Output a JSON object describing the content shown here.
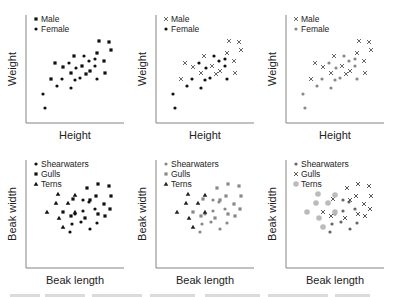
{
  "figure": {
    "colors": {
      "black": "#111111",
      "gray": "#888888",
      "light_gray": "#bbbbbb",
      "axis": "#777777"
    }
  },
  "chart_data": [
    {
      "type": "scatter",
      "panel": "top-left",
      "xlabel": "Height",
      "ylabel": "Weight",
      "legend": [
        {
          "label": "Male",
          "marker": "square",
          "color": "#111111"
        },
        {
          "label": "Female",
          "marker": "dot",
          "color": "#111111"
        }
      ],
      "series": [
        {
          "name": "Male",
          "marker": "square",
          "color": "#111111",
          "points": [
            [
              99,
              41
            ],
            [
              109,
              42
            ],
            [
              111,
              50
            ],
            [
              97,
              53
            ],
            [
              74,
              56
            ],
            [
              55,
              63
            ],
            [
              63,
              67
            ],
            [
              82,
              66
            ],
            [
              104,
              61
            ],
            [
              71,
              73
            ],
            [
              86,
              74
            ],
            [
              90,
              71
            ],
            [
              105,
              73
            ],
            [
              51,
              79
            ]
          ]
        },
        {
          "name": "Female",
          "marker": "dot",
          "color": "#111111",
          "points": [
            [
              43,
              94
            ],
            [
              45,
              108
            ],
            [
              57,
              86
            ],
            [
              62,
              79
            ],
            [
              69,
              63
            ],
            [
              71,
              88
            ],
            [
              76,
              68
            ],
            [
              75,
              80
            ],
            [
              84,
              56
            ],
            [
              80,
              78
            ],
            [
              89,
              61
            ],
            [
              95,
              59
            ],
            [
              95,
              66
            ],
            [
              97,
              79
            ]
          ]
        }
      ]
    },
    {
      "type": "scatter",
      "panel": "top-middle",
      "xlabel": "Height",
      "ylabel": "Weight",
      "legend": [
        {
          "label": "Male",
          "marker": "x",
          "color": "#555555"
        },
        {
          "label": "Female",
          "marker": "dot",
          "color": "#111111"
        }
      ],
      "series": [
        {
          "name": "Male",
          "marker": "x",
          "color": "#555555",
          "points": [
            [
              99,
              41
            ],
            [
              109,
              42
            ],
            [
              111,
              50
            ],
            [
              97,
              53
            ],
            [
              74,
              56
            ],
            [
              55,
              63
            ],
            [
              63,
              67
            ],
            [
              82,
              66
            ],
            [
              104,
              61
            ],
            [
              71,
              73
            ],
            [
              86,
              74
            ],
            [
              90,
              71
            ],
            [
              105,
              73
            ],
            [
              51,
              79
            ]
          ]
        },
        {
          "name": "Female",
          "marker": "dot",
          "color": "#111111",
          "points": [
            [
              43,
              94
            ],
            [
              45,
              108
            ],
            [
              57,
              86
            ],
            [
              62,
              79
            ],
            [
              69,
              63
            ],
            [
              71,
              88
            ],
            [
              76,
              68
            ],
            [
              75,
              80
            ],
            [
              84,
              56
            ],
            [
              80,
              78
            ],
            [
              89,
              61
            ],
            [
              95,
              59
            ],
            [
              95,
              66
            ],
            [
              97,
              79
            ]
          ]
        }
      ]
    },
    {
      "type": "scatter",
      "panel": "top-right",
      "xlabel": "Height",
      "ylabel": "Weight",
      "legend": [
        {
          "label": "Male",
          "marker": "x",
          "color": "#555555"
        },
        {
          "label": "Female",
          "marker": "dot",
          "color": "#888888"
        }
      ],
      "series": [
        {
          "name": "Male",
          "marker": "x",
          "color": "#555555",
          "points": [
            [
              99,
              41
            ],
            [
              109,
              42
            ],
            [
              111,
              50
            ],
            [
              97,
              53
            ],
            [
              74,
              56
            ],
            [
              55,
              63
            ],
            [
              63,
              67
            ],
            [
              82,
              66
            ],
            [
              104,
              61
            ],
            [
              71,
              73
            ],
            [
              86,
              74
            ],
            [
              90,
              71
            ],
            [
              105,
              73
            ],
            [
              51,
              79
            ]
          ]
        },
        {
          "name": "Female",
          "marker": "dot",
          "color": "#888888",
          "points": [
            [
              43,
              94
            ],
            [
              45,
              108
            ],
            [
              57,
              86
            ],
            [
              62,
              79
            ],
            [
              69,
              63
            ],
            [
              71,
              88
            ],
            [
              76,
              68
            ],
            [
              75,
              80
            ],
            [
              84,
              56
            ],
            [
              80,
              78
            ],
            [
              89,
              61
            ],
            [
              95,
              59
            ],
            [
              95,
              66
            ],
            [
              97,
              79
            ]
          ]
        }
      ]
    },
    {
      "type": "scatter",
      "panel": "bottom-left",
      "xlabel": "Beak length",
      "ylabel": "Beak width",
      "legend": [
        {
          "label": "Shearwaters",
          "marker": "dot",
          "color": "#111111"
        },
        {
          "label": "Gulls",
          "marker": "square",
          "color": "#111111"
        },
        {
          "label": "Terns",
          "marker": "triangle",
          "color": "#111111"
        }
      ],
      "series": [
        {
          "name": "Shearwaters",
          "marker": "dot",
          "color": "#111111",
          "points": [
            [
              83,
              200
            ],
            [
              89,
              202
            ],
            [
              83,
              211
            ],
            [
              95,
              209
            ],
            [
              75,
              214
            ],
            [
              81,
              222
            ],
            [
              72,
              224
            ],
            [
              97,
              223
            ],
            [
              70,
              232
            ],
            [
              90,
              229
            ]
          ]
        },
        {
          "name": "Gulls",
          "marker": "square",
          "color": "#111111",
          "points": [
            [
              87,
              188
            ],
            [
              98,
              184
            ],
            [
              109,
              186
            ],
            [
              73,
              199
            ],
            [
              90,
              200
            ],
            [
              96,
              196
            ],
            [
              111,
              196
            ],
            [
              104,
              204
            ],
            [
              110,
              209
            ],
            [
              63,
              212
            ],
            [
              71,
              216
            ],
            [
              85,
              218
            ],
            [
              98,
              214
            ],
            [
              105,
              216
            ]
          ]
        },
        {
          "name": "Terns",
          "marker": "triangle",
          "color": "#111111",
          "points": [
            [
              58,
              194
            ],
            [
              75,
              195
            ],
            [
              56,
              203
            ],
            [
              68,
              203
            ],
            [
              47,
              212
            ],
            [
              59,
              218
            ],
            [
              75,
              212
            ],
            [
              63,
              227
            ]
          ]
        }
      ]
    },
    {
      "type": "scatter",
      "panel": "bottom-middle",
      "xlabel": "Beak length",
      "ylabel": "Beak width",
      "legend": [
        {
          "label": "Shearwaters",
          "marker": "dot",
          "color": "#888888"
        },
        {
          "label": "Gulls",
          "marker": "square",
          "color": "#888888"
        },
        {
          "label": "Terns",
          "marker": "triangle",
          "color": "#222222"
        }
      ],
      "series": [
        {
          "name": "Shearwaters",
          "marker": "dot",
          "color": "#888888",
          "points": [
            [
              83,
              200
            ],
            [
              89,
              202
            ],
            [
              83,
              211
            ],
            [
              95,
              209
            ],
            [
              75,
              214
            ],
            [
              81,
              222
            ],
            [
              72,
              224
            ],
            [
              97,
              223
            ],
            [
              70,
              232
            ],
            [
              90,
              229
            ]
          ]
        },
        {
          "name": "Gulls",
          "marker": "square",
          "color": "#888888",
          "points": [
            [
              87,
              188
            ],
            [
              98,
              184
            ],
            [
              109,
              186
            ],
            [
              73,
              199
            ],
            [
              90,
              200
            ],
            [
              96,
              196
            ],
            [
              111,
              196
            ],
            [
              104,
              204
            ],
            [
              110,
              209
            ],
            [
              63,
              212
            ],
            [
              71,
              216
            ],
            [
              85,
              218
            ],
            [
              98,
              214
            ],
            [
              105,
              216
            ]
          ]
        },
        {
          "name": "Terns",
          "marker": "triangle",
          "color": "#222222",
          "points": [
            [
              58,
              194
            ],
            [
              75,
              195
            ],
            [
              56,
              203
            ],
            [
              68,
              203
            ],
            [
              47,
              212
            ],
            [
              59,
              218
            ],
            [
              75,
              212
            ],
            [
              63,
              227
            ]
          ]
        }
      ]
    },
    {
      "type": "scatter",
      "panel": "bottom-right",
      "xlabel": "Beak length",
      "ylabel": "Beak width",
      "legend": [
        {
          "label": "Shearwaters",
          "marker": "dot",
          "color": "#666666"
        },
        {
          "label": "Gulls",
          "marker": "x",
          "color": "#444444"
        },
        {
          "label": "Terns",
          "marker": "big-dot",
          "color": "#bbbbbb"
        }
      ],
      "series": [
        {
          "name": "Shearwaters",
          "marker": "dot",
          "color": "#666666",
          "points": [
            [
              83,
              200
            ],
            [
              89,
              202
            ],
            [
              83,
              211
            ],
            [
              95,
              209
            ],
            [
              75,
              214
            ],
            [
              81,
              222
            ],
            [
              72,
              224
            ],
            [
              97,
              223
            ],
            [
              70,
              232
            ],
            [
              90,
              229
            ]
          ]
        },
        {
          "name": "Gulls",
          "marker": "x",
          "color": "#444444",
          "points": [
            [
              87,
              188
            ],
            [
              98,
              184
            ],
            [
              109,
              186
            ],
            [
              73,
              199
            ],
            [
              90,
              200
            ],
            [
              96,
              196
            ],
            [
              111,
              196
            ],
            [
              104,
              204
            ],
            [
              110,
              209
            ],
            [
              63,
              212
            ],
            [
              71,
              216
            ],
            [
              85,
              218
            ],
            [
              98,
              214
            ],
            [
              105,
              216
            ]
          ]
        },
        {
          "name": "Terns",
          "marker": "big-dot",
          "color": "#bbbbbb",
          "points": [
            [
              58,
              194
            ],
            [
              75,
              195
            ],
            [
              56,
              203
            ],
            [
              68,
              203
            ],
            [
              47,
              212
            ],
            [
              59,
              218
            ],
            [
              75,
              212
            ],
            [
              63,
              227
            ]
          ]
        }
      ]
    }
  ]
}
